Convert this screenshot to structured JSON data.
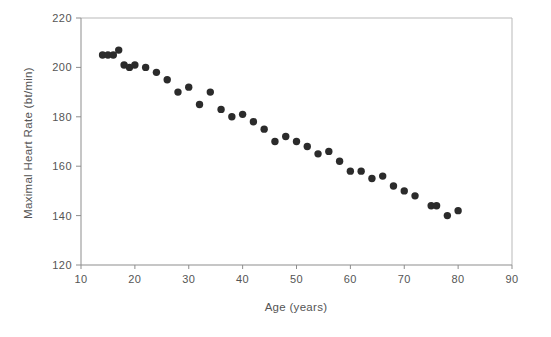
{
  "chart_data": {
    "type": "scatter",
    "title": "",
    "xlabel": "Age (years)",
    "ylabel": "Maximal Heart Rate (bt/min)",
    "xlim": [
      10,
      90
    ],
    "ylim": [
      120,
      220
    ],
    "xticks": [
      10,
      20,
      30,
      40,
      50,
      60,
      70,
      80,
      90
    ],
    "xtick_labels": [
      "10",
      "20",
      "30",
      "40",
      "50",
      "60",
      "70",
      "80",
      "90"
    ],
    "yticks": [
      120,
      140,
      160,
      180,
      200,
      220
    ],
    "ytick_labels": [
      "120",
      "140",
      "160",
      "180",
      "200",
      "220"
    ],
    "grid": false,
    "legend": null,
    "marker": {
      "shape": "circle",
      "color": "#2b2b2b",
      "size": 6
    },
    "series": [
      {
        "name": "Maximal heart rate by age",
        "points": [
          {
            "x": 14,
            "y": 205
          },
          {
            "x": 15,
            "y": 205
          },
          {
            "x": 16,
            "y": 205
          },
          {
            "x": 17,
            "y": 207
          },
          {
            "x": 18,
            "y": 201
          },
          {
            "x": 19,
            "y": 200
          },
          {
            "x": 20,
            "y": 201
          },
          {
            "x": 22,
            "y": 200
          },
          {
            "x": 24,
            "y": 198
          },
          {
            "x": 26,
            "y": 195
          },
          {
            "x": 28,
            "y": 190
          },
          {
            "x": 30,
            "y": 192
          },
          {
            "x": 32,
            "y": 185
          },
          {
            "x": 34,
            "y": 190
          },
          {
            "x": 36,
            "y": 183
          },
          {
            "x": 38,
            "y": 180
          },
          {
            "x": 40,
            "y": 181
          },
          {
            "x": 42,
            "y": 178
          },
          {
            "x": 44,
            "y": 175
          },
          {
            "x": 46,
            "y": 170
          },
          {
            "x": 48,
            "y": 172
          },
          {
            "x": 50,
            "y": 170
          },
          {
            "x": 52,
            "y": 168
          },
          {
            "x": 54,
            "y": 165
          },
          {
            "x": 56,
            "y": 166
          },
          {
            "x": 58,
            "y": 162
          },
          {
            "x": 60,
            "y": 158
          },
          {
            "x": 62,
            "y": 158
          },
          {
            "x": 64,
            "y": 155
          },
          {
            "x": 66,
            "y": 156
          },
          {
            "x": 68,
            "y": 152
          },
          {
            "x": 70,
            "y": 150
          },
          {
            "x": 72,
            "y": 148
          },
          {
            "x": 75,
            "y": 144
          },
          {
            "x": 76,
            "y": 144
          },
          {
            "x": 78,
            "y": 140
          },
          {
            "x": 80,
            "y": 142
          }
        ]
      }
    ]
  }
}
